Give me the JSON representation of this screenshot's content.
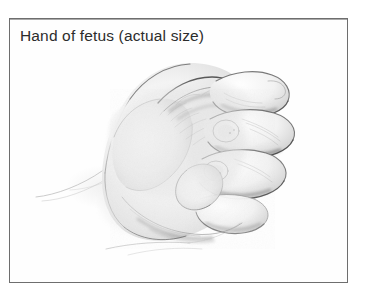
{
  "figure": {
    "caption": "Hand of fetus (actual size)",
    "illustration_name": "fetal-hand-drawing",
    "illustration_description": "Pencil drawing of a fetal hand clenched into a fist, seen from the side, with four curled fingers at the right and the thumb folded across the palm",
    "medium": "graphite pencil drawing",
    "frame": {
      "border_color": "#6e6e6e",
      "background_color": "#fefefe"
    },
    "colors": {
      "page_background": "#ffffff",
      "caption_text": "#2c2c2c",
      "graphite_dark": "#3a3a3a",
      "graphite_mid": "#636363",
      "graphite_light": "#9a9a9a",
      "graphite_faint": "#c2c2c2"
    }
  }
}
